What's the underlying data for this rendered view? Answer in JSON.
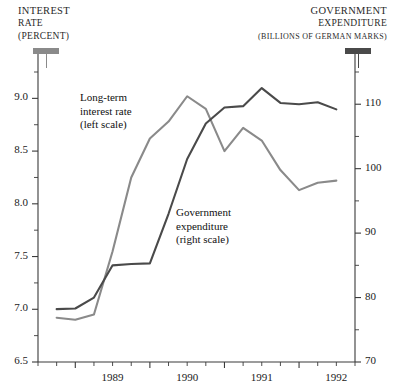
{
  "left_axis": {
    "title_lines": [
      "Interest",
      "rate",
      "(percent)"
    ],
    "swatch_color": "#8a8a8a",
    "swatch_name": "left-scale-swatch",
    "ticks": [
      6.5,
      7.0,
      7.5,
      8.0,
      8.5,
      9.0
    ],
    "tick_labels": [
      "6.5",
      "7.0",
      "7.5",
      "8.0",
      "8.5",
      "9.0"
    ],
    "range": [
      6.5,
      9.25
    ],
    "minor_step": 0.25
  },
  "right_axis": {
    "title_lines": [
      "Government",
      "expenditure",
      "(billions of German marks)"
    ],
    "swatch_color": "#4a4a4a",
    "swatch_name": "right-scale-swatch",
    "ticks": [
      70,
      80,
      90,
      100,
      110
    ],
    "tick_labels": [
      "70",
      "80",
      "90",
      "100",
      "110"
    ],
    "range": [
      70,
      115
    ],
    "minor_step": 5
  },
  "x_axis": {
    "tick_labels": [
      "1989",
      "1990",
      "1991",
      "1992"
    ],
    "tick_values": [
      1989,
      1990,
      1991,
      1992
    ],
    "range": [
      1988.5,
      1992.75
    ],
    "minor_step": 0.25
  },
  "annotations": [
    {
      "name": "annotation-rate",
      "lines": [
        "Long-term",
        "interest rate",
        "(left scale)"
      ]
    },
    {
      "name": "annotation-expenditure",
      "lines": [
        "Government",
        "expenditure",
        "(right scale)"
      ]
    }
  ],
  "colors": {
    "interest_rate_line": "#8a8a8a",
    "expenditure_line": "#4a4a4a",
    "axis": "#3a3a3a",
    "background": "#ffffff"
  },
  "chart_data": {
    "type": "line",
    "title": "",
    "subtitle": "",
    "xlabel": "",
    "ylabel": "Interest rate (percent)",
    "y2label": "Government expenditure (billions of German marks)",
    "xlim": [
      1988.5,
      1992.75
    ],
    "ylim": [
      6.5,
      9.25
    ],
    "y2lim": [
      70,
      115
    ],
    "grid": false,
    "legend": "inline-annotations",
    "x": [
      1988.75,
      1989.0,
      1989.25,
      1989.5,
      1989.75,
      1990.0,
      1990.25,
      1990.5,
      1990.75,
      1991.0,
      1991.25,
      1991.5,
      1991.75,
      1992.0,
      1992.25,
      1992.5
    ],
    "series": [
      {
        "name": "Long-term interest rate (left scale)",
        "axis": "left",
        "color": "#8a8a8a",
        "unit": "percent",
        "values": [
          6.92,
          6.9,
          6.95,
          7.55,
          8.25,
          8.62,
          8.78,
          9.02,
          8.9,
          8.5,
          8.72,
          8.6,
          8.32,
          8.13,
          8.2,
          8.22
        ]
      },
      {
        "name": "Government expenditure (right scale)",
        "axis": "right",
        "color": "#4a4a4a",
        "unit": "billions of German marks",
        "values": [
          78.2,
          78.3,
          80.0,
          85.0,
          85.2,
          85.3,
          93.0,
          101.5,
          107.0,
          109.5,
          109.7,
          112.5,
          110.2,
          110.0,
          110.3,
          109.2
        ]
      }
    ]
  }
}
